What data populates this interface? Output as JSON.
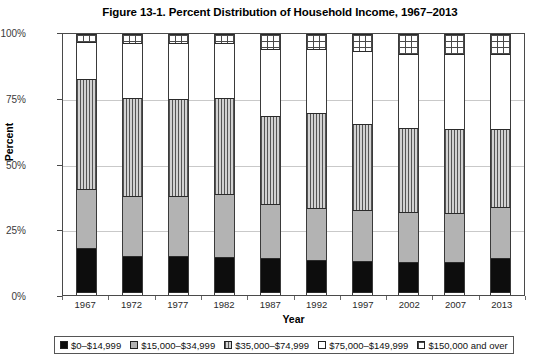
{
  "chart_data": {
    "type": "bar",
    "title": "Figure 13-1. Percent Distribution of Household Income, 1967–2013",
    "xlabel": "Year",
    "ylabel": "Percent",
    "ylim": [
      0,
      100
    ],
    "yticks": [
      "0%",
      "25%",
      "50%",
      "75%",
      "100%"
    ],
    "ytick_values": [
      0,
      25,
      50,
      75,
      100
    ],
    "grid": true,
    "stacked": true,
    "legend_position": "bottom",
    "categories": [
      "1967",
      "1972",
      "1977",
      "1982",
      "1987",
      "1992",
      "1997",
      "2002",
      "2007",
      "2013"
    ],
    "series": [
      {
        "name": "$0–$14,999",
        "pattern": "solid-black",
        "color": "#0d0d0d",
        "values": [
          17.0,
          14.0,
          14.0,
          13.5,
          13.0,
          12.5,
          12.0,
          11.5,
          11.5,
          13.0
        ]
      },
      {
        "name": "$15,000–$34,999",
        "pattern": "solid-gray",
        "color": "#b3b3b3",
        "values": [
          23.0,
          23.0,
          23.0,
          24.5,
          21.0,
          20.0,
          20.0,
          19.5,
          19.0,
          20.0
        ]
      },
      {
        "name": "$35,000–$74,999",
        "pattern": "vertical-lines",
        "color": "#d2d2d2",
        "values": [
          42.0,
          38.0,
          37.5,
          37.0,
          34.0,
          36.5,
          33.0,
          32.5,
          32.5,
          30.0
        ]
      },
      {
        "name": "$75,000–$149,999",
        "pattern": "white",
        "color": "#ffffff",
        "values": [
          14.5,
          21.0,
          21.5,
          21.0,
          26.0,
          25.0,
          28.0,
          28.5,
          29.0,
          29.0
        ]
      },
      {
        "name": "$150,000 and over",
        "pattern": "crosshatch-grid",
        "color": "#ffffff",
        "values": [
          3.5,
          4.0,
          4.0,
          4.0,
          6.0,
          6.0,
          7.0,
          8.0,
          8.0,
          8.0
        ]
      }
    ]
  }
}
